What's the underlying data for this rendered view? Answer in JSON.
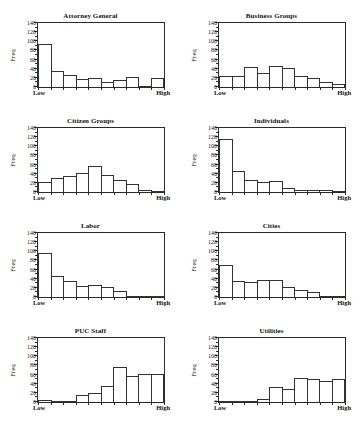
{
  "figure": {
    "top_clipped_caption": "",
    "background_color": "#ffffff",
    "bar_edge_color": "#333333",
    "axis_color": "#2b2b2b",
    "panel_rows": 4,
    "panel_columns": 2
  },
  "axis": {
    "ylabel": "Freq",
    "yticks": [
      0,
      20,
      40,
      60,
      80,
      100,
      120,
      140
    ],
    "ymin": 0,
    "ymax": 140,
    "x_low_label": "Low",
    "x_high_label": "High",
    "n_bins": 10
  },
  "chart_data": [
    {
      "type": "bar",
      "title": "Attorney General",
      "xlabel": "",
      "ylabel": "Freq",
      "ylim": [
        0,
        140
      ],
      "yticks": [
        0,
        20,
        40,
        60,
        80,
        100,
        120,
        140
      ],
      "categories": [
        "1",
        "2",
        "3",
        "4",
        "5",
        "6",
        "7",
        "8",
        "9",
        "10"
      ],
      "xtick_labels": [
        "Low",
        "",
        "",
        "",
        "",
        "",
        "",
        "",
        "",
        "High"
      ],
      "values": [
        94,
        36,
        26,
        17,
        20,
        10,
        15,
        22,
        3,
        19
      ],
      "grid": false,
      "legend": "none"
    },
    {
      "type": "bar",
      "title": "Business Groups",
      "xlabel": "",
      "ylabel": "Freq",
      "ylim": [
        0,
        140
      ],
      "yticks": [
        0,
        20,
        40,
        60,
        80,
        100,
        120,
        140
      ],
      "categories": [
        "1",
        "2",
        "3",
        "4",
        "5",
        "6",
        "7",
        "8",
        "9",
        "10"
      ],
      "xtick_labels": [
        "Low",
        "",
        "",
        "",
        "",
        "",
        "",
        "",
        "",
        "High"
      ],
      "values": [
        24,
        25,
        44,
        30,
        45,
        42,
        25,
        19,
        10,
        6
      ],
      "grid": false,
      "legend": "none"
    },
    {
      "type": "bar",
      "title": "Citizen Groups",
      "xlabel": "",
      "ylabel": "Freq",
      "ylim": [
        0,
        140
      ],
      "yticks": [
        0,
        20,
        40,
        60,
        80,
        100,
        120,
        140
      ],
      "categories": [
        "1",
        "2",
        "3",
        "4",
        "5",
        "6",
        "7",
        "8",
        "9",
        "10"
      ],
      "xtick_labels": [
        "Low",
        "",
        "",
        "",
        "",
        "",
        "",
        "",
        "",
        "High"
      ],
      "values": [
        22,
        31,
        35,
        42,
        58,
        38,
        26,
        17,
        4,
        2
      ],
      "grid": false,
      "legend": "none"
    },
    {
      "type": "bar",
      "title": "Individuals",
      "xlabel": "",
      "ylabel": "Freq",
      "ylim": [
        0,
        140
      ],
      "yticks": [
        0,
        20,
        40,
        60,
        80,
        100,
        120,
        140
      ],
      "categories": [
        "1",
        "2",
        "3",
        "4",
        "5",
        "6",
        "7",
        "8",
        "9",
        "10"
      ],
      "xtick_labels": [
        "Low",
        "",
        "",
        "",
        "",
        "",
        "",
        "",
        "",
        "High"
      ],
      "values": [
        117,
        46,
        26,
        23,
        24,
        8,
        5,
        5,
        4,
        2
      ],
      "grid": false,
      "legend": "none"
    },
    {
      "type": "bar",
      "title": "Labor",
      "xlabel": "",
      "ylabel": "Freq",
      "ylim": [
        0,
        140
      ],
      "yticks": [
        0,
        20,
        40,
        60,
        80,
        100,
        120,
        140
      ],
      "categories": [
        "1",
        "2",
        "3",
        "4",
        "5",
        "6",
        "7",
        "8",
        "9",
        "10"
      ],
      "xtick_labels": [
        "Low",
        "",
        "",
        "",
        "",
        "",
        "",
        "",
        "",
        "High"
      ],
      "values": [
        97,
        45,
        34,
        25,
        27,
        21,
        14,
        2,
        1,
        1
      ],
      "grid": false,
      "legend": "none"
    },
    {
      "type": "bar",
      "title": "Cities",
      "xlabel": "",
      "ylabel": "Freq",
      "ylim": [
        0,
        140
      ],
      "yticks": [
        0,
        20,
        40,
        60,
        80,
        100,
        120,
        140
      ],
      "categories": [
        "1",
        "2",
        "3",
        "4",
        "5",
        "6",
        "7",
        "8",
        "9",
        "10"
      ],
      "xtick_labels": [
        "Low",
        "",
        "",
        "",
        "",
        "",
        "",
        "",
        "",
        "High"
      ],
      "values": [
        70,
        36,
        33,
        38,
        38,
        23,
        16,
        12,
        2,
        1
      ],
      "grid": false,
      "legend": "none"
    },
    {
      "type": "bar",
      "title": "PUC Staff",
      "xlabel": "",
      "ylabel": "Freq",
      "ylim": [
        0,
        140
      ],
      "yticks": [
        0,
        20,
        40,
        60,
        80,
        100,
        120,
        140
      ],
      "categories": [
        "1",
        "2",
        "3",
        "4",
        "5",
        "6",
        "7",
        "8",
        "9",
        "10"
      ],
      "xtick_labels": [
        "Low",
        "",
        "",
        "",
        "",
        "",
        "",
        "",
        "",
        "High"
      ],
      "values": [
        4,
        1,
        3,
        15,
        19,
        36,
        77,
        56,
        62,
        62
      ],
      "grid": false,
      "legend": "none"
    },
    {
      "type": "bar",
      "title": "Utilities",
      "xlabel": "",
      "ylabel": "Freq",
      "ylim": [
        0,
        140
      ],
      "yticks": [
        0,
        20,
        40,
        60,
        80,
        100,
        120,
        140
      ],
      "categories": [
        "1",
        "2",
        "3",
        "4",
        "5",
        "6",
        "7",
        "8",
        "9",
        "10"
      ],
      "xtick_labels": [
        "Low",
        "",
        "",
        "",
        "",
        "",
        "",
        "",
        "",
        "High"
      ],
      "values": [
        1,
        2,
        3,
        7,
        33,
        28,
        53,
        50,
        46,
        50
      ],
      "grid": false,
      "legend": "none"
    }
  ]
}
